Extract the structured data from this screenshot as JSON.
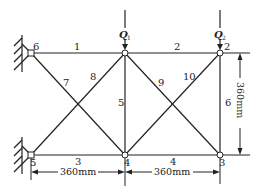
{
  "diagram": {
    "type": "truss",
    "colors": {
      "line": "#222222",
      "background": "#ffffff"
    },
    "nodes": [
      {
        "id": "1",
        "label": "",
        "x": 125,
        "y": 53
      },
      {
        "id": "2",
        "label": "2",
        "x": 220,
        "y": 53
      },
      {
        "id": "3",
        "label": "3",
        "x": 220,
        "y": 155
      },
      {
        "id": "4",
        "label": "4",
        "x": 125,
        "y": 155
      },
      {
        "id": "5",
        "label": "5",
        "x": 31,
        "y": 155
      },
      {
        "id": "6",
        "label": "6",
        "x": 31,
        "y": 53
      }
    ],
    "members": [
      {
        "label": "1",
        "from": "6",
        "to": "1"
      },
      {
        "label": "2",
        "from": "1",
        "to": "2"
      },
      {
        "label": "3",
        "from": "5",
        "to": "4"
      },
      {
        "label": "4",
        "from": "4",
        "to": "3"
      },
      {
        "label": "5",
        "from": "1",
        "to": "4"
      },
      {
        "label": "6",
        "from": "2",
        "to": "3"
      },
      {
        "label": "7",
        "from": "6",
        "to": "4"
      },
      {
        "label": "8",
        "from": "5",
        "to": "1"
      },
      {
        "label": "9",
        "from": "1",
        "to": "3"
      },
      {
        "label": "10",
        "from": "4",
        "to": "2"
      }
    ],
    "loads": [
      {
        "symbol": "Q",
        "subscript": "1",
        "at": "1"
      },
      {
        "symbol": "Q",
        "subscript": "2",
        "at": "2"
      }
    ],
    "supports": [
      {
        "at": "6",
        "type": "fixed-wall"
      },
      {
        "at": "5",
        "type": "fixed-wall"
      }
    ],
    "dimensions": {
      "bottom_left": "360mm",
      "bottom_right": "360mm",
      "right_vertical": "360mm"
    }
  }
}
